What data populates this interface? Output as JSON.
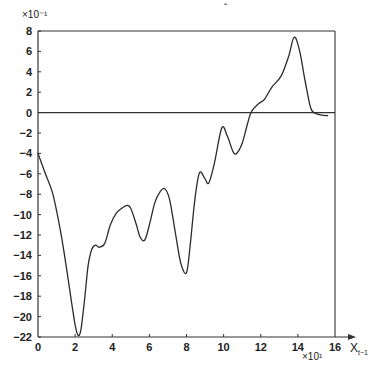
{
  "chart_data": {
    "type": "line",
    "title": "",
    "xlabel": "X_{t-1}",
    "xlabel_main": "X",
    "xlabel_sub": "t−1",
    "ylabel": "",
    "x_multiplier": "×10¹",
    "y_multiplier": "×10⁻¹",
    "xlim": [
      0,
      16
    ],
    "ylim": [
      -22,
      8
    ],
    "x_ticks": [
      0,
      2,
      4,
      6,
      8,
      10,
      12,
      14,
      16
    ],
    "x_tick_labels": [
      "0",
      "2",
      "4",
      "6",
      "8",
      "10",
      "12",
      "14",
      "16"
    ],
    "y_ticks": [
      8,
      6,
      4,
      2,
      0,
      -2,
      -4,
      -6,
      -8,
      -10,
      -12,
      -14,
      -16,
      -18,
      -20,
      -22
    ],
    "y_tick_labels": [
      "8",
      "6",
      "4",
      "2",
      "0",
      "−2",
      "−4",
      "−6",
      "−8",
      "−10",
      "−12",
      "−14",
      "−16",
      "−18",
      "−20",
      "−22"
    ],
    "grid": false,
    "legend": null,
    "reference_lines": [
      {
        "axis": "y",
        "value": 0
      }
    ],
    "series": [
      {
        "name": "curve",
        "x": [
          0.0,
          0.4,
          0.8,
          1.2,
          1.5,
          1.8,
          2.0,
          2.15,
          2.3,
          2.5,
          2.7,
          2.9,
          3.1,
          3.3,
          3.6,
          3.9,
          4.2,
          4.5,
          4.8,
          5.0,
          5.3,
          5.5,
          5.75,
          6.0,
          6.3,
          6.6,
          6.85,
          7.1,
          7.4,
          7.7,
          8.0,
          8.2,
          8.45,
          8.7,
          9.0,
          9.2,
          9.5,
          9.9,
          10.2,
          10.5,
          10.7,
          11.0,
          11.3,
          11.5,
          11.9,
          12.2,
          12.6,
          13.1,
          13.5,
          13.8,
          14.1,
          14.4,
          14.7,
          15.0,
          15.3,
          15.6
        ],
        "y": [
          -4.0,
          -6.0,
          -8.0,
          -11.5,
          -14.8,
          -18.5,
          -20.8,
          -21.8,
          -21.4,
          -18.5,
          -15.0,
          -13.4,
          -13.0,
          -13.2,
          -12.8,
          -11.0,
          -9.9,
          -9.4,
          -9.1,
          -9.4,
          -11.0,
          -12.2,
          -12.5,
          -11.0,
          -8.8,
          -7.7,
          -7.5,
          -8.6,
          -11.8,
          -14.8,
          -15.7,
          -13.0,
          -8.5,
          -5.9,
          -6.5,
          -6.9,
          -5.0,
          -1.5,
          -2.3,
          -3.8,
          -4.0,
          -3.0,
          -1.0,
          0.1,
          0.9,
          1.3,
          2.5,
          3.6,
          5.5,
          7.4,
          6.0,
          3.0,
          0.4,
          -0.1,
          -0.25,
          -0.3
        ]
      }
    ]
  },
  "annotations": {
    "top_caret": "ˆ"
  }
}
